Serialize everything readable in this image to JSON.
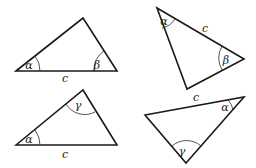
{
  "diagram": {
    "title": "",
    "triangles": [
      {
        "id": "triangle-1",
        "vertices": [
          [
            16,
            71
          ],
          [
            83,
            18
          ],
          [
            117,
            71
          ]
        ],
        "side_label": {
          "text": "c",
          "x": 65,
          "y": 82
        },
        "angles": [
          {
            "symbol": "α",
            "vertex": 0,
            "x": 29,
            "y": 69,
            "arc": "M 40 71 A 24 24 0 0 0 35 56"
          },
          {
            "symbol": "β",
            "vertex": 2,
            "x": 97,
            "y": 69,
            "arc": "M 94 71 A 23 23 0 0 1 104 51"
          }
        ]
      },
      {
        "id": "triangle-2",
        "vertices": [
          [
            157,
            8
          ],
          [
            244,
            59
          ],
          [
            187,
            89
          ]
        ],
        "side_label": {
          "text": "c",
          "x": 205,
          "y": 32
        },
        "angles": [
          {
            "symbol": "α",
            "vertex": 0,
            "x": 164,
            "y": 25,
            "arc": "M 162 28 A 20 20 0 0 0 175 19"
          },
          {
            "symbol": "β",
            "vertex": 1,
            "x": 226,
            "y": 64,
            "arc": "M 222 46 A 25 25 0 0 0 222 70"
          }
        ]
      },
      {
        "id": "triangle-3",
        "vertices": [
          [
            16,
            145
          ],
          [
            83,
            90
          ],
          [
            117,
            145
          ]
        ],
        "side_label": {
          "text": "c",
          "x": 65,
          "y": 158
        },
        "angles": [
          {
            "symbol": "α",
            "vertex": 0,
            "x": 29,
            "y": 143,
            "arc": "M 40 145 A 24 24 0 0 0 35 130"
          },
          {
            "symbol": "γ",
            "vertex": 1,
            "x": 78,
            "y": 109,
            "arc": "M 66 104 A 22 22 0 0 0 95 112"
          }
        ]
      },
      {
        "id": "triangle-4",
        "vertices": [
          [
            145,
            115
          ],
          [
            244,
            97
          ],
          [
            186,
            163
          ]
        ],
        "side_label": {
          "text": "c",
          "x": 196,
          "y": 101
        },
        "angles": [
          {
            "symbol": "α",
            "vertex": 1,
            "x": 225,
            "y": 111,
            "arc": "M 228 100 A 17 17 0 0 1 233 110"
          },
          {
            "symbol": "γ",
            "vertex": 2,
            "x": 182,
            "y": 155,
            "arc": "M 172 146 A 22 22 0 0 1 201 146"
          }
        ]
      }
    ]
  }
}
